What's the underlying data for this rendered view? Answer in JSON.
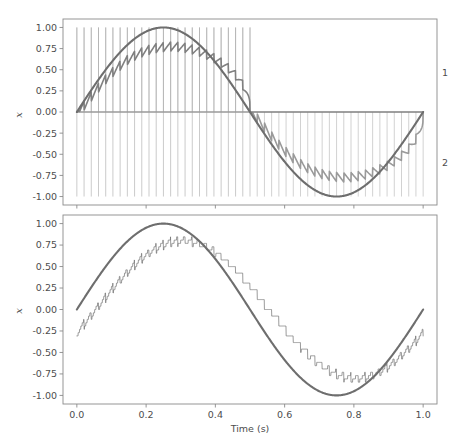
{
  "figure": {
    "width": 470,
    "height": 446,
    "background": "#ffffff",
    "n_panels": 2
  },
  "colors": {
    "sine_reference": "#6e6e6e",
    "filtered_pos": "#808080",
    "filtered_neg": "#9a9a9a",
    "pwm_stem_pos": "#a8a8a8",
    "pwm_stem_neg": "#b4b4b4",
    "ripple": "#707070",
    "axis": "#8a8a8a",
    "text": "#4d4d4d"
  },
  "chart_data": [
    {
      "type": "line",
      "panel": "top",
      "title": "",
      "xlabel": "",
      "ylabel": "x",
      "xlim": [
        -0.04,
        1.04
      ],
      "ylim": [
        -1.1,
        1.1
      ],
      "xticks": [
        0.0,
        0.2,
        0.4,
        0.6,
        0.8,
        1.0
      ],
      "xticklabels": [
        "",
        "",
        "",
        "",
        "",
        ""
      ],
      "yticks": [
        1.0,
        0.75,
        0.5,
        0.25,
        0.0,
        -0.25,
        -0.5,
        -0.75,
        -1.0
      ],
      "yticklabels": [
        "1.00",
        "0.75",
        "0.50",
        "0.25",
        "0.00",
        "-0.25",
        "-0.50",
        "-0.75",
        "-1.00"
      ],
      "grid": false,
      "legend_position": "right-outside",
      "annotations": [
        {
          "text": "1",
          "x": 1.045,
          "y": 0.46
        },
        {
          "text": "2",
          "x": 1.045,
          "y": -0.54
        }
      ],
      "series": [
        {
          "name": "sine reference",
          "style": "solid-thick",
          "color": "#6e6e6e",
          "description": "sin(2*pi*f*t) reference, f = 1 Hz, amplitude 1.0, zero at t=0",
          "frequency_hz": 1.0,
          "amplitude": 1.0,
          "phase": 0.0
        },
        {
          "name": "1",
          "style": "solid-med",
          "color": "#808080",
          "description": "positive-half filtered PWM envelope; rides near 0.75 during positive lobes with high-frequency ripple, flat 0.0 during negative lobes"
        },
        {
          "name": "2",
          "style": "solid-med",
          "color": "#9a9a9a",
          "description": "negative-half filtered PWM envelope; rides near -0.75 during negative lobes with ripple, flat 0.0 during positive lobes"
        },
        {
          "name": "pwm pulses positive",
          "style": "stems",
          "color": "#a8a8a8",
          "description": "vertical impulse train from 0 to -1.0 and 0 to +1.0, active during positive half cycles 0.0-0.28 and 0.60-1.0"
        },
        {
          "name": "pwm pulses negative",
          "style": "stems",
          "color": "#b4b4b4",
          "description": "vertical impulse train active during negative half cycles 0.28-0.60"
        }
      ],
      "pwm_carrier_hz": 48
    },
    {
      "type": "line",
      "panel": "bottom",
      "title": "",
      "xlabel": "Time (s)",
      "ylabel": "x",
      "xlim": [
        -0.04,
        1.04
      ],
      "ylim": [
        -1.1,
        1.1
      ],
      "xticks": [
        0.0,
        0.2,
        0.4,
        0.6,
        0.8,
        1.0
      ],
      "xticklabels": [
        "0.0",
        "0.2",
        "0.4",
        "0.6",
        "0.8",
        "1.0"
      ],
      "yticks": [
        1.0,
        0.75,
        0.5,
        0.25,
        0.0,
        -0.25,
        -0.5,
        -0.75,
        -1.0
      ],
      "yticklabels": [
        "1.00",
        "0.75",
        "0.50",
        "0.25",
        "0.00",
        "-0.25",
        "-0.50",
        "-0.75",
        "-1.00"
      ],
      "grid": false,
      "legend_position": "none",
      "series": [
        {
          "name": "sine reference",
          "style": "solid-thick",
          "color": "#6e6e6e",
          "description": "sin(2*pi*f*t) reference, f = 1 Hz, amplitude 1.0",
          "frequency_hz": 1.0,
          "amplitude": 1.0,
          "phase": 0.0
        },
        {
          "name": "quantized ripple output",
          "style": "solid-thin",
          "color": "#707070",
          "description": "lagging staircase/sawtooth reconstruction tracking the sine with high frequency ripple; peaks clipped near 0.78 and troughs near -0.78, ends near -0.10 at t=1.0"
        }
      ],
      "ripple_carrier_hz": 48
    }
  ]
}
